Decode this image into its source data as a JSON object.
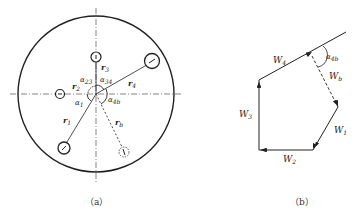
{
  "figure_a": {
    "caption": "（a）",
    "labels": {
      "r1": "r",
      "r1_sub": "1",
      "r2": "r",
      "r2_sub": "2",
      "r3": "r",
      "r3_sub": "3",
      "r4": "r",
      "r4_sub": "4",
      "rb": "r",
      "rb_sub": "b",
      "alpha1": "α",
      "alpha1_sub": "1",
      "alpha23": "α",
      "alpha23_sub": "23",
      "alpha34": "α",
      "alpha34_sub": "34",
      "alpha4b": "α",
      "alpha4b_sub": "4b"
    }
  },
  "figure_b": {
    "caption": "（b）",
    "labels": {
      "W1": "W",
      "W1_sub": "1",
      "W2": "W",
      "W2_sub": "2",
      "W3": "W",
      "W3_sub": "3",
      "W4": "W",
      "W4_sub": "4",
      "Wb": "W",
      "Wb_sub": "b",
      "alpha4b": "α",
      "alpha4b_sub": "4b"
    }
  },
  "colors": {
    "stroke": "#222222",
    "background": "#ffffff"
  }
}
